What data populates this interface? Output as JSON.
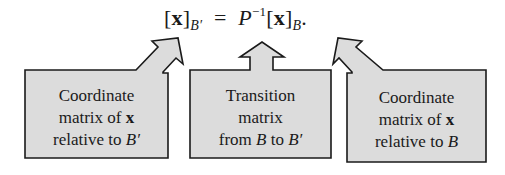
{
  "equation": {
    "lhs_open": "[",
    "lhs_var": "x",
    "lhs_close": "]",
    "lhs_sub": "B′",
    "equals": "=",
    "matrix": "P",
    "exponent": "−1",
    "rhs_open": "[",
    "rhs_var": "x",
    "rhs_close": "]",
    "rhs_sub": "B",
    "period": "."
  },
  "boxes": [
    {
      "line1": "Coordinate",
      "line2_text": "matrix of ",
      "line2_bold": "x",
      "line3_text": "relative to ",
      "line3_italic": "B′"
    },
    {
      "line1": "Transition",
      "line2_text": "matrix",
      "line3_text": "from ",
      "line3_italic_a": "B",
      "line3_mid": " to ",
      "line3_italic_b": "B′"
    },
    {
      "line1": "Coordinate",
      "line2_text": "matrix of ",
      "line2_bold": "x",
      "line3_text": "relative to ",
      "line3_italic": "B"
    }
  ],
  "colors": {
    "box_fill": "#dcdcdc",
    "box_stroke": "#1a1a1a",
    "text": "#1a1a1a",
    "background": "#ffffff"
  }
}
